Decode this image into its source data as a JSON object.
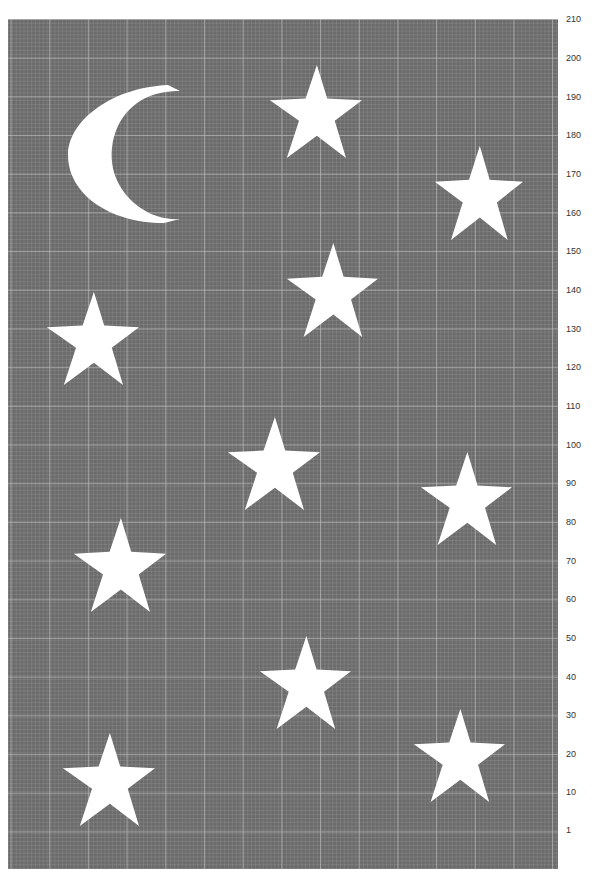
{
  "chart": {
    "title": "",
    "type": "knitting-colorwork-chart",
    "background_color": "#6b6b6b",
    "motif_color": "#ffffff",
    "grid_line_color": "#c8c8c8",
    "major_grid_every": 10
  },
  "row_labels": [
    {
      "label": "210",
      "y": 19
    },
    {
      "label": "200",
      "y": 58
    },
    {
      "label": "190",
      "y": 97
    },
    {
      "label": "180",
      "y": 135
    },
    {
      "label": "170",
      "y": 174
    },
    {
      "label": "160",
      "y": 213
    },
    {
      "label": "150",
      "y": 251
    },
    {
      "label": "140",
      "y": 290
    },
    {
      "label": "130",
      "y": 329
    },
    {
      "label": "120",
      "y": 367
    },
    {
      "label": "110",
      "y": 406
    },
    {
      "label": "100",
      "y": 445
    },
    {
      "label": "90",
      "y": 483
    },
    {
      "label": "80",
      "y": 522
    },
    {
      "label": "70",
      "y": 561
    },
    {
      "label": "60",
      "y": 599
    },
    {
      "label": "50",
      "y": 638
    },
    {
      "label": "40",
      "y": 677
    },
    {
      "label": "30",
      "y": 715
    },
    {
      "label": "20",
      "y": 754
    },
    {
      "label": "10",
      "y": 792
    },
    {
      "label": "1",
      "y": 830
    }
  ],
  "motifs": [
    {
      "type": "moon",
      "left": 68,
      "top": 83,
      "width": 112,
      "height": 142
    },
    {
      "type": "star",
      "left": 268,
      "top": 65,
      "width": 94,
      "height": 93
    },
    {
      "type": "star",
      "left": 433,
      "top": 146,
      "width": 90,
      "height": 94
    },
    {
      "type": "star",
      "left": 285,
      "top": 243,
      "width": 93,
      "height": 94
    },
    {
      "type": "star",
      "left": 45,
      "top": 292,
      "width": 94,
      "height": 93
    },
    {
      "type": "star",
      "left": 226,
      "top": 417,
      "width": 94,
      "height": 93
    },
    {
      "type": "star",
      "left": 419,
      "top": 452,
      "width": 93,
      "height": 93
    },
    {
      "type": "star",
      "left": 72,
      "top": 518,
      "width": 94,
      "height": 94
    },
    {
      "type": "star",
      "left": 258,
      "top": 636,
      "width": 93,
      "height": 93
    },
    {
      "type": "star",
      "left": 412,
      "top": 709,
      "width": 93,
      "height": 93
    },
    {
      "type": "star",
      "left": 61,
      "top": 733,
      "width": 94,
      "height": 93
    }
  ]
}
